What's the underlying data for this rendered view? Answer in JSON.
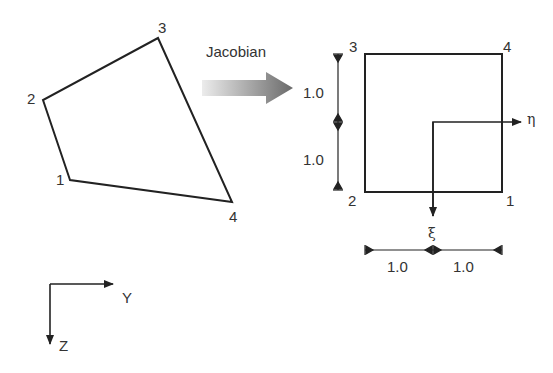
{
  "diagram": {
    "physical_element": {
      "nodes": [
        {
          "id": "1",
          "label": "1",
          "x": 70,
          "y": 180
        },
        {
          "id": "2",
          "label": "2",
          "x": 43,
          "y": 100
        },
        {
          "id": "3",
          "label": "3",
          "x": 158,
          "y": 38
        },
        {
          "id": "4",
          "label": "4",
          "x": 232,
          "y": 202
        }
      ]
    },
    "transform": {
      "label": "Jacobian"
    },
    "reference_element": {
      "nodes": [
        {
          "id": "1",
          "label": "1"
        },
        {
          "id": "2",
          "label": "2"
        },
        {
          "id": "3",
          "label": "3"
        },
        {
          "id": "4",
          "label": "4"
        }
      ],
      "axes": {
        "eta": "η",
        "xi": "ξ"
      },
      "dimensions": {
        "vertical_top": "1.0",
        "vertical_bottom": "1.0",
        "horizontal_left": "1.0",
        "horizontal_right": "1.0"
      }
    },
    "global_axes": {
      "y_label": "Y",
      "z_label": "Z"
    },
    "colors": {
      "stroke": "#222222",
      "text": "#333333",
      "arrow_gradient_start": "#e8e8e8",
      "arrow_gradient_end": "#6e6e6e"
    }
  }
}
